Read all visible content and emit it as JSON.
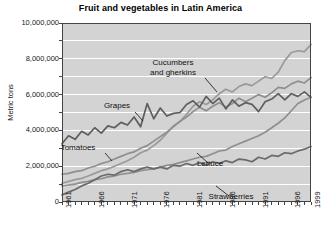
{
  "chart_data": {
    "type": "line",
    "title": "Fruit and vegetables in Latin America",
    "xlabel": "",
    "ylabel": "Metric tons",
    "xlim": [
      1961,
      1999
    ],
    "ylim": [
      0,
      10000000
    ],
    "grid": true,
    "legend_position": "inline-annotations",
    "ytick_labels": [
      "10,000,000",
      "8,000,000",
      "6,000,000",
      "4,000,000",
      "2,000,000",
      "0"
    ],
    "ytick_values": [
      10000000,
      8000000,
      6000000,
      4000000,
      2000000,
      0
    ],
    "ygrid_step": 1000000,
    "xtick_labels": [
      "1961",
      "1966",
      "1971",
      "1976",
      "1981",
      "1986",
      "1991",
      "1996",
      "1999"
    ],
    "xtick_values": [
      1961,
      1966,
      1971,
      1976,
      1981,
      1986,
      1991,
      1996,
      1999
    ],
    "x": [
      1961,
      1962,
      1963,
      1964,
      1965,
      1966,
      1967,
      1968,
      1969,
      1970,
      1971,
      1972,
      1973,
      1974,
      1975,
      1976,
      1977,
      1978,
      1979,
      1980,
      1981,
      1982,
      1983,
      1984,
      1985,
      1986,
      1987,
      1988,
      1989,
      1990,
      1991,
      1992,
      1993,
      1994,
      1995,
      1996,
      1997,
      1998,
      1999
    ],
    "series": [
      {
        "name": "Cucumbers and gherkins",
        "color": "#9a9a9a",
        "values": [
          1050000,
          1150000,
          1250000,
          1320000,
          1450000,
          1600000,
          1750000,
          1850000,
          2000000,
          2150000,
          2300000,
          2500000,
          2750000,
          2900000,
          3150000,
          3450000,
          3850000,
          4250000,
          4500000,
          4900000,
          5350000,
          5600000,
          5450000,
          5700000,
          6050000,
          6300000,
          6150000,
          6450000,
          6600000,
          6500000,
          6750000,
          7000000,
          6900000,
          7250000,
          7900000,
          8350000,
          8450000,
          8400000,
          8800000
        ]
      },
      {
        "name": "Tomatoes",
        "color": "#8f8f8f",
        "values": [
          1550000,
          1600000,
          1700000,
          1750000,
          1900000,
          2000000,
          2150000,
          2250000,
          2400000,
          2550000,
          2700000,
          2800000,
          3000000,
          3150000,
          3400000,
          3650000,
          3900000,
          4200000,
          4500000,
          4750000,
          5050000,
          5300000,
          5100000,
          5350000,
          5550000,
          5300000,
          5500000,
          5800000,
          5600000,
          5800000,
          6000000,
          5850000,
          6100000,
          6400000,
          6350000,
          6600000,
          6750000,
          6650000,
          6950000
        ]
      },
      {
        "name": "Grapes",
        "color": "#5e5e5e",
        "values": [
          3250000,
          3700000,
          3500000,
          3950000,
          3750000,
          4150000,
          3850000,
          4250000,
          4150000,
          4450000,
          4300000,
          4750000,
          4200000,
          5500000,
          4650000,
          5250000,
          4800000,
          4950000,
          5000000,
          5450000,
          5650000,
          5300000,
          5900000,
          5500000,
          5800000,
          5200000,
          5700000,
          5350000,
          5550000,
          5450000,
          5050000,
          5600000,
          5750000,
          6050000,
          5700000,
          6050000,
          5900000,
          6150000,
          5850000
        ]
      },
      {
        "name": "Lettuce",
        "color": "#8f8f8f",
        "values": [
          900000,
          950000,
          1000000,
          1100000,
          1150000,
          1250000,
          1300000,
          1400000,
          1450000,
          1550000,
          1600000,
          1650000,
          1750000,
          1800000,
          1850000,
          1950000,
          2050000,
          2100000,
          2200000,
          2300000,
          2400000,
          2500000,
          2550000,
          2700000,
          2850000,
          2900000,
          3100000,
          3250000,
          3400000,
          3550000,
          3700000,
          3900000,
          4150000,
          4400000,
          4700000,
          5100000,
          5500000,
          5700000,
          5850000
        ]
      },
      {
        "name": "Strawberries",
        "color": "#6a6a6a",
        "values": [
          400000,
          550000,
          700000,
          900000,
          1050000,
          1250000,
          1450000,
          1550000,
          1500000,
          1700000,
          1800000,
          1700000,
          1850000,
          1950000,
          1850000,
          1950000,
          1850000,
          2050000,
          2000000,
          2150000,
          2050000,
          2200000,
          2050000,
          2250000,
          2150000,
          2300000,
          2200000,
          2400000,
          2350000,
          2250000,
          2500000,
          2400000,
          2600000,
          2550000,
          2750000,
          2700000,
          2850000,
          2950000,
          3100000
        ]
      }
    ],
    "annotations": [
      {
        "id": "cucumbers",
        "text_line1": "Cucumbers",
        "text_line2": "and gherkins",
        "label_x": 173,
        "label_y": 58,
        "leader_from_x": 205,
        "leader_from_y": 78,
        "leader_to_x": 217,
        "leader_to_y": 92
      },
      {
        "id": "grapes",
        "text_line1": "Grapes",
        "text_line2": "",
        "label_x": 117,
        "label_y": 101,
        "leader_from_x": 135,
        "leader_from_y": 112,
        "leader_to_x": 143,
        "leader_to_y": 121
      },
      {
        "id": "tomatoes",
        "text_line1": "Tomatoes",
        "text_line2": "",
        "label_x": 78,
        "label_y": 143,
        "leader_from_x": 105,
        "leader_from_y": 153,
        "leader_to_x": 112,
        "leader_to_y": 161
      },
      {
        "id": "lettuce",
        "text_line1": "Lettuce",
        "text_line2": "",
        "label_x": 210,
        "label_y": 159,
        "leader_from_x": 208,
        "leader_from_y": 163,
        "leader_to_x": 197,
        "leader_to_y": 153
      },
      {
        "id": "strawberries",
        "text_line1": "Strawberries",
        "text_line2": "",
        "label_x": 231,
        "label_y": 192,
        "leader_from_x": 229,
        "leader_from_y": 196,
        "leader_to_x": 216,
        "leader_to_y": 186
      }
    ],
    "style": {
      "plot_background": "#d3d3d3",
      "gridline_color": "#ffffff",
      "axis_color": "#444444",
      "text_color": "#111111",
      "figure_background": "#ffffff"
    },
    "plot_box": {
      "left": 62,
      "top": 23,
      "right": 311,
      "bottom": 202
    }
  }
}
